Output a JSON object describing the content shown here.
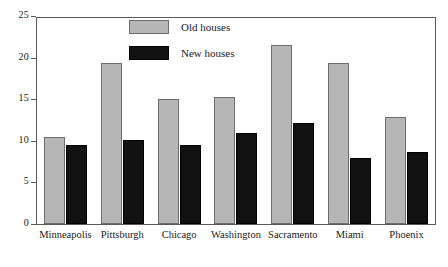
{
  "chart_data": {
    "type": "bar",
    "title": "",
    "subtitle": "",
    "xlabel": "",
    "ylabel": "",
    "ylim": [
      0,
      25
    ],
    "yticks": [
      0,
      5,
      10,
      15,
      20,
      25
    ],
    "grid": false,
    "legend_position": "top-center",
    "categories": [
      "Minneapolis",
      "Pittsburgh",
      "Chicago",
      "Washington",
      "Sacramento",
      "Miami",
      "Phoenix"
    ],
    "series": [
      {
        "name": "Old houses",
        "color": "#b6b6b6",
        "values": [
          10.6,
          19.5,
          15.2,
          15.4,
          21.7,
          19.6,
          13.0
        ]
      },
      {
        "name": "New houses",
        "color": "#111111",
        "values": [
          9.6,
          10.2,
          9.6,
          11.1,
          12.3,
          8.0,
          8.7
        ]
      }
    ]
  },
  "axis": {
    "y_tick_labels": [
      "0",
      "5",
      "10",
      "15",
      "20",
      "25"
    ]
  },
  "legend": {
    "items": [
      {
        "label": "Old houses",
        "swatch": "old-houses-swatch"
      },
      {
        "label": "New houses",
        "swatch": "new-houses-swatch"
      }
    ]
  }
}
